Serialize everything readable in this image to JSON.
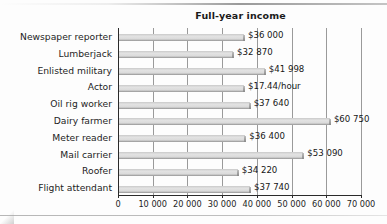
{
  "chart_data": {
    "type": "bar",
    "orientation": "horizontal",
    "title": "Full-year income",
    "xlabel": "",
    "ylabel": "",
    "xlim": [
      0,
      70000
    ],
    "grid": "vertical",
    "legend": "none",
    "categories": [
      "Newspaper reporter",
      "Lumberjack",
      "Enlisted military",
      "Actor",
      "Oil rig worker",
      "Dairy farmer",
      "Meter reader",
      "Mail carrier",
      "Roofer",
      "Flight attendant"
    ],
    "values": [
      36000,
      32870,
      41998,
      36000,
      37640,
      60750,
      36400,
      53090,
      34220,
      37740
    ],
    "data_labels": [
      "$36 000",
      "$32 870",
      "$41 998",
      "$17.44/hour",
      "$37 640",
      "$60 750",
      "$36 400",
      "$53 090",
      "$34 220",
      "$37 740"
    ],
    "xticks": [
      0,
      10000,
      20000,
      30000,
      40000,
      50000,
      60000,
      70000
    ],
    "xtick_labels": [
      "0",
      "10 000",
      "20 000",
      "30 000",
      "40 000",
      "50 000",
      "60 000",
      "70 000"
    ],
    "colors": {
      "bar_fill": "#dcdcdc",
      "bar_shadow": "#8f8f8f",
      "axis": "#2a2a2a",
      "gridline": "#9a9a9a",
      "text": "#1d1d1d",
      "background": "#fdfdfd"
    }
  }
}
